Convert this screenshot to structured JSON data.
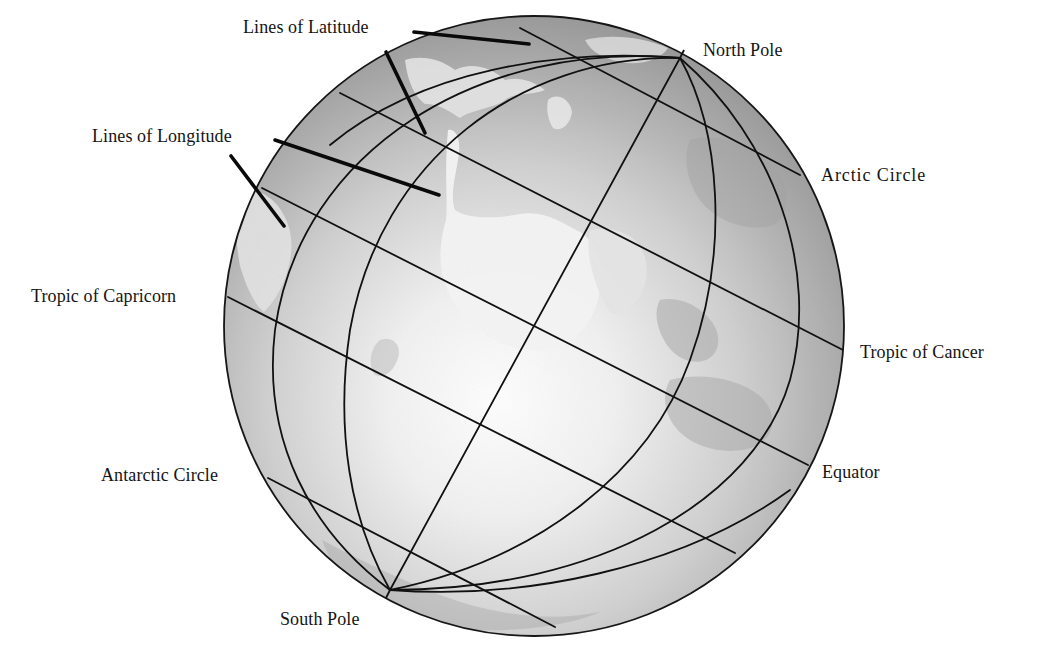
{
  "colors": {
    "background": "#ffffff",
    "ocean_dark": "#9a9a9a",
    "ocean_mid": "#c4c4c4",
    "highlight": "#ffffff",
    "land": "#e6e6e6",
    "land_shade": "#b2b2b2",
    "grid_line": "#111111",
    "leader_line": "#0a0a0a"
  },
  "labels": {
    "lines_of_latitude": "Lines of Latitude",
    "lines_of_longitude": "Lines of Longitude",
    "north_pole": "North Pole",
    "arctic_circle": "Arctic Circle",
    "tropic_of_capricorn": "Tropic of Capricorn",
    "tropic_of_cancer": "Tropic of Cancer",
    "equator": "Equator",
    "antarctic_circle": "Antarctic Circle",
    "south_pole": "South Pole"
  },
  "globe": {
    "center": [
      534,
      326
    ],
    "radius": 310,
    "north_pole": [
      680,
      58
    ],
    "south_pole": [
      390,
      590
    ]
  },
  "latitude_lines": [
    {
      "name": "arctic-circle-line",
      "from": [
        520,
        28
      ],
      "to": [
        800,
        175
      ]
    },
    {
      "name": "tropic-of-cancer-line",
      "from": [
        340,
        93
      ],
      "to": [
        843,
        350
      ]
    },
    {
      "name": "equator-line",
      "from": [
        262,
        188
      ],
      "to": [
        808,
        465
      ]
    },
    {
      "name": "tropic-of-capricorn-line",
      "from": [
        228,
        297
      ],
      "to": [
        735,
        553
      ]
    },
    {
      "name": "antarctic-circle-line",
      "from": [
        268,
        478
      ],
      "to": [
        555,
        627
      ]
    }
  ]
}
